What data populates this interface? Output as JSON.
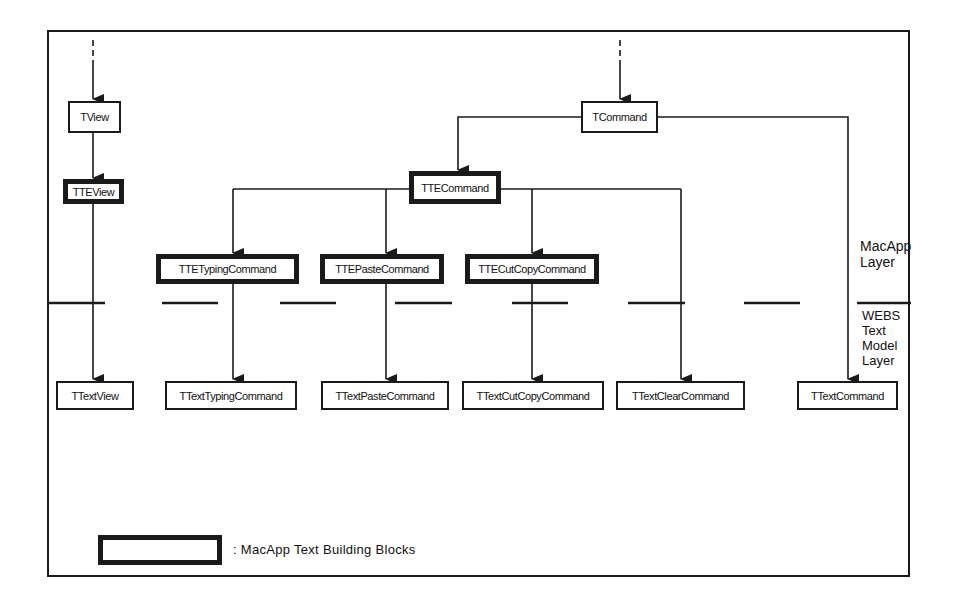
{
  "diagram": {
    "macapp_classes": [
      {
        "id": "tview",
        "label": "TView",
        "building_block": false
      },
      {
        "id": "tteview",
        "label": "TTEView",
        "building_block": true
      },
      {
        "id": "tcommand",
        "label": "TCommand",
        "building_block": false
      },
      {
        "id": "ttecommand",
        "label": "TTECommand",
        "building_block": true
      },
      {
        "id": "ttetypingcommand",
        "label": "TTETypingCommand",
        "building_block": true
      },
      {
        "id": "ttepastecommand",
        "label": "TTEPasteCommand",
        "building_block": true
      },
      {
        "id": "ttecutcopycommand",
        "label": "TTECutCopyCommand",
        "building_block": true
      }
    ],
    "webs_classes": [
      {
        "id": "ttextview",
        "label": "TTextView"
      },
      {
        "id": "ttexttypingcommand",
        "label": "TTextTypingCommand"
      },
      {
        "id": "ttextpastecommand",
        "label": "TTextPasteCommand"
      },
      {
        "id": "ttextcutcopycommand",
        "label": "TTextCutCopyCommand"
      },
      {
        "id": "ttextclearcommand",
        "label": "TTextClearCommand"
      },
      {
        "id": "ttextcommand",
        "label": "TTextCommand"
      }
    ],
    "edges": [
      {
        "from": "(ancestor)",
        "to": "TView",
        "style": "dashed-then-solid"
      },
      {
        "from": "TView",
        "to": "TTEView"
      },
      {
        "from": "TTEView",
        "to": "TTextView"
      },
      {
        "from": "(ancestor)",
        "to": "TCommand",
        "style": "dashed-then-solid"
      },
      {
        "from": "TCommand",
        "to": "TTECommand"
      },
      {
        "from": "TCommand",
        "to": "TTextCommand"
      },
      {
        "from": "TTECommand",
        "to": "TTETypingCommand"
      },
      {
        "from": "TTECommand",
        "to": "TTEPasteCommand"
      },
      {
        "from": "TTECommand",
        "to": "TTECutCopyCommand"
      },
      {
        "from": "TTECommand",
        "to": "TTextClearCommand"
      },
      {
        "from": "TTETypingCommand",
        "to": "TTextTypingCommand"
      },
      {
        "from": "TTEPasteCommand",
        "to": "TTextPasteCommand"
      },
      {
        "from": "TTECutCopyCommand",
        "to": "TTextCutCopyCommand"
      }
    ],
    "layers": {
      "upper": {
        "line1": "MacApp",
        "line2": "Layer"
      },
      "lower": {
        "line1": "WEBS",
        "line2": "Text",
        "line3": "Model",
        "line4": "Layer"
      }
    },
    "legend": {
      "text": ": MacApp Text Building Blocks"
    }
  }
}
